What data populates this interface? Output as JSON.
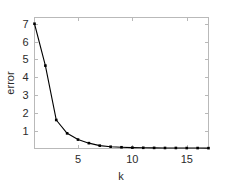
{
  "chart_data": {
    "type": "line",
    "title": "",
    "xlabel": "k",
    "ylabel": "error",
    "x": [
      1,
      2,
      3,
      4,
      5,
      6,
      7,
      8,
      9,
      10,
      11,
      12,
      13,
      14,
      15,
      16,
      17
    ],
    "values": [
      7.0,
      4.65,
      1.6,
      0.85,
      0.5,
      0.3,
      0.16,
      0.1,
      0.07,
      0.05,
      0.04,
      0.035,
      0.03,
      0.03,
      0.025,
      0.025,
      0.02
    ],
    "series": [
      {
        "name": "error",
        "values": [
          7.0,
          4.65,
          1.6,
          0.85,
          0.5,
          0.3,
          0.16,
          0.1,
          0.07,
          0.05,
          0.04,
          0.035,
          0.03,
          0.03,
          0.025,
          0.025,
          0.02
        ]
      }
    ],
    "xlim": [
      1,
      17
    ],
    "ylim": [
      0,
      7.35
    ],
    "xticks": [
      5,
      10,
      15
    ],
    "xticklabels": [
      "5",
      "10",
      "15"
    ],
    "yticks": [
      1,
      2,
      3,
      4,
      5,
      6,
      7
    ],
    "yticklabels": [
      "1",
      "2",
      "3",
      "4",
      "5",
      "6",
      "7"
    ],
    "grid": false,
    "legend": null,
    "marker": "square",
    "line_color": "#000000",
    "marker_color": "#000000",
    "axis_color": "#b9b9b9",
    "background": "#ffffff"
  },
  "axes": {
    "xlabel": "k",
    "ylabel": "error",
    "xticklabels": [
      "5",
      "10",
      "15"
    ],
    "yticklabels": [
      "1",
      "2",
      "3",
      "4",
      "5",
      "6",
      "7"
    ]
  }
}
